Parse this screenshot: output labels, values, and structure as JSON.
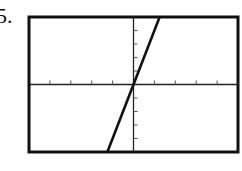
{
  "problem_label": "5.",
  "chart_data": {
    "type": "line",
    "title": "",
    "xlabel": "",
    "ylabel": "",
    "xlim": [
      -5,
      5
    ],
    "ylim": [
      -5,
      5
    ],
    "xticks": [
      -4,
      -3,
      -2,
      -1,
      1,
      2,
      3,
      4
    ],
    "yticks": [
      -4,
      -3,
      -2,
      -1,
      1,
      2,
      3,
      4
    ],
    "tick_labels_shown": false,
    "grid": false,
    "legend": null,
    "series": [
      {
        "name": "y = 4x",
        "x": [
          -1.25,
          0,
          1.25
        ],
        "y": [
          -5,
          0,
          5
        ]
      }
    ]
  },
  "colors": {
    "frame": "#111111",
    "axis": "#222222",
    "line": "#111111"
  }
}
